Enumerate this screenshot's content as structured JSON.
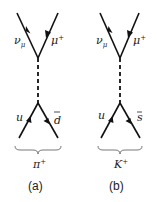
{
  "diagrams": [
    {
      "id": "a",
      "caption": "(a)",
      "meson": "π",
      "meson_charge": "+",
      "top_left_particle": "ν",
      "top_left_sub": "μ",
      "top_right_particle": "μ",
      "top_right_sup": "+",
      "bottom_left_quark": "u",
      "bottom_right_quark": "d",
      "bottom_right_bar": true
    },
    {
      "id": "b",
      "caption": "(b)",
      "meson": "K",
      "meson_charge": "+",
      "top_left_particle": "ν",
      "top_left_sub": "μ",
      "top_right_particle": "μ",
      "top_right_sup": "+",
      "bottom_left_quark": "u",
      "bottom_right_quark": "s",
      "bottom_right_bar": true
    }
  ],
  "colors": {
    "line": "#111111",
    "text": "#222222"
  }
}
